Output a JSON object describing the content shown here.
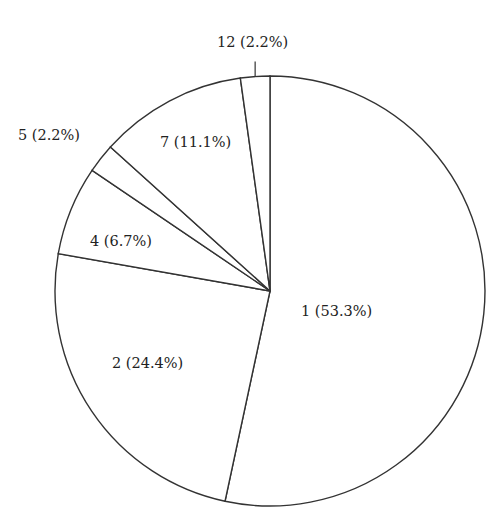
{
  "chart_data": {
    "type": "pie",
    "title": "",
    "start_angle": "12 o'clock",
    "direction": "clockwise",
    "slices": [
      {
        "label": "1",
        "percent": 53.3,
        "text": "1 (53.3%)"
      },
      {
        "label": "2",
        "percent": 24.4,
        "text": "2 (24.4%)"
      },
      {
        "label": "4",
        "percent": 6.7,
        "text": "4 (6.7%)"
      },
      {
        "label": "5",
        "percent": 2.2,
        "text": "5 (2.2%)"
      },
      {
        "label": "7",
        "percent": 11.1,
        "text": "7 (11.1%)"
      },
      {
        "label": "12",
        "percent": 2.2,
        "text": "12 (2.2%)"
      }
    ],
    "colors": {
      "fill": "#ffffff",
      "stroke": "#333333",
      "text": "#222222"
    }
  }
}
